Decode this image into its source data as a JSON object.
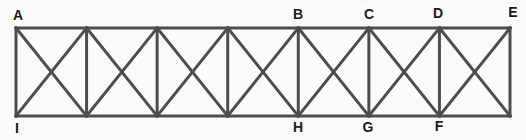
{
  "diagram": {
    "background_color": "#fbfbfb",
    "member_color": "#4d4d4d",
    "member_stroke_width": 3,
    "label_color": "#1b1b1b",
    "label_font_size": 14,
    "geometry": {
      "left_x": 16,
      "right_x": 510,
      "top_y": 28,
      "bottom_y": 116,
      "panel_count": 7,
      "has_top_chord": true,
      "has_bottom_chord": true,
      "has_vertical_posts": true,
      "diagonals_per_panel": "X"
    },
    "top_labels": [
      {
        "text": "A",
        "x": 18,
        "y": 20
      },
      {
        "text": "B",
        "x": 298,
        "y": 19
      },
      {
        "text": "C",
        "x": 369,
        "y": 19
      },
      {
        "text": "D",
        "x": 438,
        "y": 18
      },
      {
        "text": "E",
        "x": 513,
        "y": 17
      }
    ],
    "bottom_labels": [
      {
        "text": "I",
        "x": 17,
        "y": 133
      },
      {
        "text": "H",
        "x": 298,
        "y": 132
      },
      {
        "text": "G",
        "x": 368,
        "y": 132
      },
      {
        "text": "F",
        "x": 439,
        "y": 131
      }
    ]
  }
}
